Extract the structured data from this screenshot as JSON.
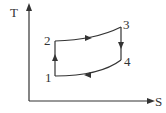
{
  "diagram": {
    "type": "T-S cycle diagram",
    "axes": {
      "y_label": "T",
      "x_label": "S"
    },
    "points": [
      {
        "id": "1",
        "label": "1"
      },
      {
        "id": "2",
        "label": "2"
      },
      {
        "id": "3",
        "label": "3"
      },
      {
        "id": "4",
        "label": "4"
      }
    ],
    "processes": [
      {
        "from": "1",
        "to": "2",
        "shape": "vertical line, upward"
      },
      {
        "from": "2",
        "to": "3",
        "shape": "rising curve, rightward"
      },
      {
        "from": "3",
        "to": "4",
        "shape": "vertical line, downward"
      },
      {
        "from": "4",
        "to": "1",
        "shape": "falling curve, leftward"
      }
    ],
    "line_color": "#333333"
  }
}
